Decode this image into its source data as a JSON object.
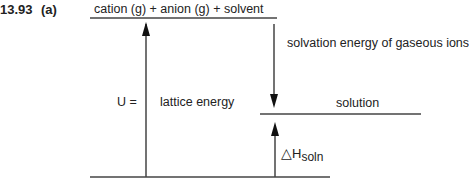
{
  "problem": {
    "number": "13.93",
    "part": "(a)"
  },
  "diagram": {
    "type": "energy-level diagram",
    "levels": {
      "top": "cation (g) + anion (g) + solvent",
      "middle": "solution",
      "bottom": ""
    },
    "arrows": {
      "lattice": {
        "prefix": "U =",
        "label": "lattice energy",
        "direction": "up"
      },
      "solvation": {
        "label": "solvation energy of gaseous ions",
        "direction": "down"
      },
      "solution": {
        "delta": "△",
        "symbol": "H",
        "subscript": "soln",
        "direction": "up"
      }
    }
  }
}
